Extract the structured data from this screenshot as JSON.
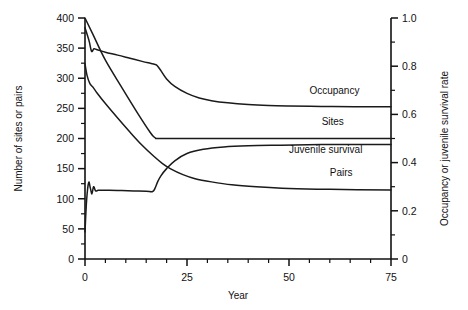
{
  "chart_data": {
    "type": "line",
    "title": "",
    "xlabel": "Year",
    "ylabel": "Number of sites or pairs",
    "y2label": "Occupancy or juvenile survival rate",
    "xlim": [
      0,
      75
    ],
    "ylim": [
      0,
      400
    ],
    "y2lim": [
      0,
      1.0
    ],
    "grid": false,
    "legend_position": "inline-right-of-curves",
    "xticks": [
      0,
      25,
      50,
      75
    ],
    "xticklabels": [
      "0",
      "25",
      "50",
      "75"
    ],
    "xminorticks": [
      5,
      10,
      15,
      20,
      30,
      35,
      40,
      45,
      55,
      60,
      65,
      70
    ],
    "yticks": [
      0,
      50,
      100,
      150,
      200,
      250,
      300,
      350,
      400
    ],
    "yticklabels": [
      "0",
      "50",
      "100",
      "150",
      "200",
      "250",
      "300",
      "350",
      "400"
    ],
    "y2ticks": [
      0,
      0.2,
      0.4,
      0.6,
      0.8,
      1.0
    ],
    "y2ticklabels": [
      "0",
      "0.2",
      "0.4",
      "0.6",
      "0.8",
      "1.0"
    ],
    "y2minorticks": [
      0.1,
      0.3,
      0.5,
      0.7,
      0.9
    ],
    "line_color": "#1a1a1a",
    "series": [
      {
        "name": "Occupancy",
        "axis": "right",
        "label": "Occupancy",
        "label_x": 55,
        "label_y": 0.685,
        "x": [
          0,
          1,
          1.6,
          2.2,
          3,
          5,
          8,
          11,
          14,
          16,
          17,
          17.6,
          18.5,
          20,
          22,
          25,
          28,
          31,
          35,
          40,
          45,
          50,
          58,
          66,
          75
        ],
        "y": [
          0.96,
          0.905,
          0.862,
          0.872,
          0.868,
          0.858,
          0.846,
          0.833,
          0.82,
          0.812,
          0.808,
          0.804,
          0.784,
          0.747,
          0.716,
          0.687,
          0.668,
          0.657,
          0.648,
          0.641,
          0.637,
          0.635,
          0.633,
          0.632,
          0.632
        ]
      },
      {
        "name": "Sites",
        "axis": "left",
        "label": "Sites",
        "label_x": 58,
        "label_y": 222,
        "x": [
          0,
          2,
          5,
          9,
          13,
          16,
          17,
          17.5,
          18,
          25,
          40,
          60,
          75
        ],
        "y": [
          400,
          372,
          330,
          285,
          241,
          210,
          202,
          200,
          200,
          200,
          200,
          200,
          200
        ]
      },
      {
        "name": "Juvenile survival",
        "axis": "right",
        "label": "Juvenile survival",
        "label_x": 50,
        "label_y": 0.44,
        "x": [
          0,
          0.5,
          1.2,
          2,
          3,
          5,
          8,
          11,
          14,
          17,
          19,
          21,
          24,
          27,
          31,
          36,
          42,
          50,
          60,
          75
        ],
        "y": [
          0.81,
          0.762,
          0.728,
          0.712,
          0.688,
          0.645,
          0.585,
          0.527,
          0.472,
          0.424,
          0.396,
          0.374,
          0.35,
          0.333,
          0.32,
          0.308,
          0.3,
          0.293,
          0.289,
          0.286
        ]
      },
      {
        "name": "Pairs",
        "axis": "left",
        "label": "Pairs",
        "label_x": 60,
        "label_y": 138,
        "x": [
          0,
          0.4,
          0.9,
          1.3,
          1.7,
          2.1,
          2.6,
          3.2,
          4,
          6,
          9,
          12,
          15,
          16.6,
          17.2,
          17.8,
          18.6,
          20,
          22,
          25,
          29,
          34,
          40,
          48,
          58,
          68,
          75
        ],
        "y": [
          45,
          98,
          127,
          118,
          108,
          120,
          113,
          114,
          114,
          114,
          113.5,
          113,
          112.5,
          112,
          118,
          128,
          138,
          150,
          163,
          175,
          182,
          186,
          188,
          189,
          190,
          190,
          190
        ]
      }
    ]
  }
}
